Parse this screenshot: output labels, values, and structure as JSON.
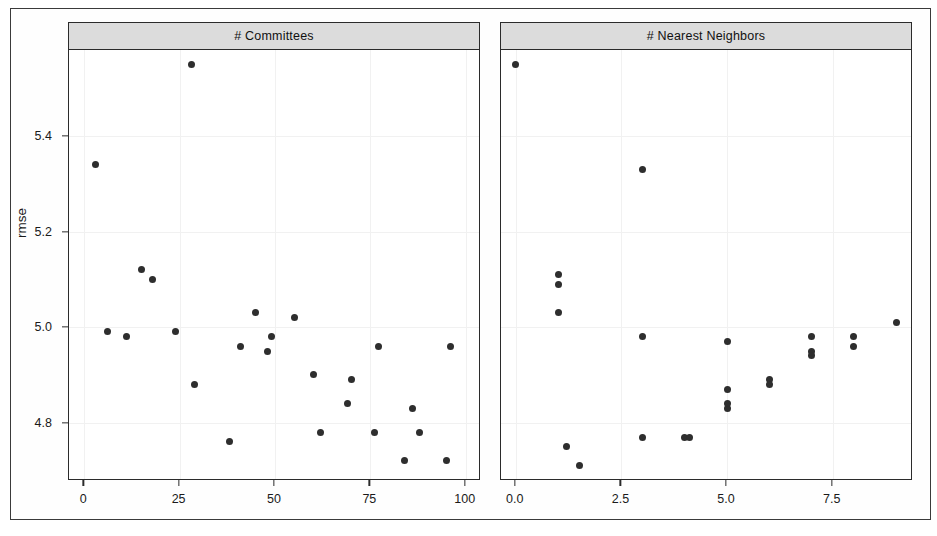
{
  "figure": {
    "ylabel": "rmse",
    "y_ticks": [
      "5.4",
      "5.2",
      "5.0",
      "4.8"
    ]
  },
  "panels": [
    {
      "name": "committees",
      "strip_label": "# Committees",
      "x_ticks": [
        "0",
        "25",
        "50",
        "75",
        "100"
      ]
    },
    {
      "name": "nearest-neighbors",
      "strip_label": "# Nearest Neighbors",
      "x_ticks": [
        "0.0",
        "2.5",
        "5.0",
        "7.5"
      ]
    }
  ],
  "chart_data": {
    "type": "scatter",
    "title": "",
    "ylabel": "rmse",
    "ylim": [
      4.68,
      5.58
    ],
    "y_ticks": [
      5.4,
      5.2,
      5.0,
      4.8
    ],
    "grid": true,
    "legend": "none",
    "panels": [
      {
        "strip_label": "# Committees",
        "xlabel": "",
        "xlim": [
          -4,
          104
        ],
        "x_ticks": [
          0,
          25,
          50,
          75,
          100
        ],
        "points": [
          {
            "x": 3,
            "y": 5.34
          },
          {
            "x": 6,
            "y": 4.99
          },
          {
            "x": 11,
            "y": 4.98
          },
          {
            "x": 15,
            "y": 5.12
          },
          {
            "x": 18,
            "y": 5.1
          },
          {
            "x": 24,
            "y": 4.99
          },
          {
            "x": 28,
            "y": 5.55
          },
          {
            "x": 29,
            "y": 4.88
          },
          {
            "x": 38,
            "y": 4.76
          },
          {
            "x": 41,
            "y": 4.96
          },
          {
            "x": 45,
            "y": 5.03
          },
          {
            "x": 48,
            "y": 4.95
          },
          {
            "x": 49,
            "y": 4.98
          },
          {
            "x": 55,
            "y": 5.02
          },
          {
            "x": 60,
            "y": 4.9
          },
          {
            "x": 62,
            "y": 4.78
          },
          {
            "x": 69,
            "y": 4.84
          },
          {
            "x": 70,
            "y": 4.89
          },
          {
            "x": 76,
            "y": 4.78
          },
          {
            "x": 77,
            "y": 4.96
          },
          {
            "x": 84,
            "y": 4.72
          },
          {
            "x": 86,
            "y": 4.83
          },
          {
            "x": 88,
            "y": 4.78
          },
          {
            "x": 95,
            "y": 4.72
          },
          {
            "x": 96,
            "y": 4.96
          }
        ]
      },
      {
        "strip_label": "# Nearest Neighbors",
        "xlabel": "",
        "xlim": [
          -0.35,
          9.4
        ],
        "x_ticks": [
          0.0,
          2.5,
          5.0,
          7.5
        ],
        "points": [
          {
            "x": 0.0,
            "y": 5.55
          },
          {
            "x": 1.0,
            "y": 5.11
          },
          {
            "x": 1.0,
            "y": 5.09
          },
          {
            "x": 1.0,
            "y": 5.03
          },
          {
            "x": 1.2,
            "y": 4.75
          },
          {
            "x": 1.5,
            "y": 4.71
          },
          {
            "x": 3.0,
            "y": 5.33
          },
          {
            "x": 3.0,
            "y": 4.98
          },
          {
            "x": 3.0,
            "y": 4.77
          },
          {
            "x": 4.0,
            "y": 4.77
          },
          {
            "x": 4.1,
            "y": 4.77
          },
          {
            "x": 5.0,
            "y": 4.97
          },
          {
            "x": 5.0,
            "y": 4.87
          },
          {
            "x": 5.0,
            "y": 4.83
          },
          {
            "x": 5.0,
            "y": 4.84
          },
          {
            "x": 6.0,
            "y": 4.89
          },
          {
            "x": 6.0,
            "y": 4.88
          },
          {
            "x": 7.0,
            "y": 4.98
          },
          {
            "x": 7.0,
            "y": 4.95
          },
          {
            "x": 7.0,
            "y": 4.94
          },
          {
            "x": 8.0,
            "y": 4.98
          },
          {
            "x": 8.0,
            "y": 4.96
          },
          {
            "x": 9.0,
            "y": 5.01
          }
        ]
      }
    ]
  }
}
